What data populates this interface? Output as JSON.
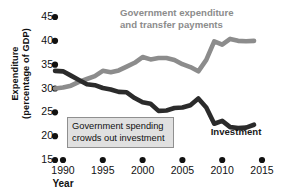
{
  "chart_data": {
    "type": "line",
    "title": "",
    "xlabel": "Year",
    "ylabel": "Expenditure (percentage of GDP)",
    "ylabel_line1": "Expenditure",
    "ylabel_line2": "(percentage of GDP)",
    "xlim": [
      1989,
      2015
    ],
    "ylim": [
      15,
      45
    ],
    "grid": false,
    "legend": "inline-labels",
    "y_ticks": [
      45,
      40,
      35,
      30,
      25,
      20,
      15
    ],
    "x_ticks": [
      1990,
      1995,
      2000,
      2005,
      2010,
      2015
    ],
    "x": [
      1989,
      1990,
      1991,
      1992,
      1993,
      1994,
      1995,
      1996,
      1997,
      1998,
      1999,
      2000,
      2001,
      2002,
      2003,
      2004,
      2005,
      2006,
      2007,
      2008,
      2009,
      2010,
      2011,
      2012,
      2013,
      2014
    ],
    "series": [
      {
        "name": "Government expenditure and transfer payments",
        "color": "#8c8c8c",
        "values": [
          30.0,
          30.2,
          30.6,
          31.4,
          32.0,
          32.6,
          33.7,
          33.4,
          33.8,
          34.6,
          35.4,
          36.6,
          36.1,
          36.4,
          36.4,
          36.0,
          35.1,
          34.5,
          33.6,
          36.0,
          39.9,
          39.2,
          40.4,
          40.0,
          39.9,
          40.0
        ]
      },
      {
        "name": "Investment",
        "color": "#2b2b2b",
        "values": [
          33.7,
          33.6,
          32.7,
          31.8,
          30.9,
          30.7,
          30.1,
          29.8,
          29.3,
          29.2,
          28.0,
          27.1,
          26.8,
          25.3,
          25.4,
          25.9,
          26.0,
          26.5,
          27.9,
          26.0,
          22.6,
          23.2,
          21.9,
          21.7,
          21.8,
          22.4
        ]
      }
    ],
    "annotations": [
      {
        "name": "crowding-out-callout",
        "line1": "Government spending",
        "line2": "crowds out investment"
      }
    ],
    "series_labels": {
      "expenditure_line1": "Government expenditure",
      "expenditure_line2": "and transfer payments",
      "investment": "Investment"
    }
  }
}
